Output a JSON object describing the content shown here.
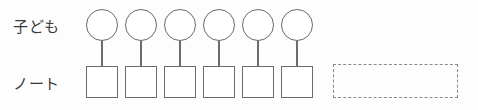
{
  "diagram": {
    "type": "one-to-one-correspondence-tape-diagram",
    "background_color": "#fdfdfd",
    "stroke_color": "#6b6b6b",
    "dashed_stroke_color": "#8a8a8a",
    "text_color": "#3a3a3a",
    "rows": [
      {
        "label": "子ども",
        "shape": "circle",
        "count": 6,
        "items": [
          "",
          "",
          "",
          "",
          "",
          ""
        ]
      },
      {
        "label": "ノート",
        "shape": "square",
        "count": 6,
        "items": [
          "",
          "",
          "",
          "",
          "",
          ""
        ]
      }
    ],
    "connectors": {
      "count": 6,
      "orientation": "vertical"
    },
    "dashed_region": {
      "label": "",
      "style": "dashed",
      "content": ""
    }
  }
}
